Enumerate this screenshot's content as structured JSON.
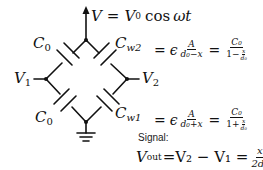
{
  "diagram": {
    "type": "capacitive-bridge-circuit",
    "supply_label": {
      "lhs": "V",
      "rhs_prefix": "V",
      "rhs_sub": "0",
      "rhs_func": "cos",
      "rhs_arg": "ωt"
    },
    "capacitors": {
      "top_left": {
        "symbol": "C",
        "sub": "0"
      },
      "top_right": {
        "symbol": "C",
        "sub": "w2"
      },
      "bottom_left": {
        "symbol": "C",
        "sub": "0"
      },
      "bottom_right": {
        "symbol": "C",
        "sub": "w1"
      }
    },
    "nodes": {
      "left": {
        "symbol": "V",
        "sub": "1"
      },
      "right": {
        "symbol": "V",
        "sub": "2"
      }
    },
    "equations": {
      "cw2": {
        "eq": "=",
        "eps": "ϵ",
        "num1": "A",
        "den1": "d₀−x",
        "num2": "C₀",
        "den2_prefix": "1−",
        "den2_inner_num": "x",
        "den2_inner_den": "d₀"
      },
      "cw1": {
        "eq": "=",
        "eps": "ϵ",
        "num1": "A",
        "den1": "d₀+x",
        "num2": "C₀",
        "den2_prefix": "1+",
        "den2_inner_num": "x",
        "den2_inner_den": "d₀"
      }
    },
    "signal_label": "Signal:",
    "vout": {
      "lhs": "V",
      "lhs_sub": "out",
      "mid": "=V₂ − V₁ =",
      "frac_num": "x",
      "frac_den": "2d₀",
      "rhs": "V"
    },
    "colors": {
      "line": "#111111",
      "background": "#ffffff"
    }
  }
}
